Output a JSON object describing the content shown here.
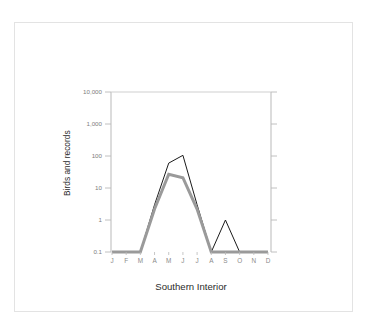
{
  "figure": {
    "title": "Southern Interior",
    "y_axis_label": "Birds and records"
  },
  "colors": {
    "series_birds": "#1a1a1a",
    "series_records": "#9a9a9a",
    "axis": "#b9b9b9",
    "tick_text": "#7d7d7d",
    "title_text": "#2b2b2b",
    "border": "#e3e3e3",
    "background": "#ffffff"
  },
  "chart_data": {
    "type": "line",
    "title": "Southern Interior",
    "xlabel": "Southern Interior",
    "ylabel": "Birds and records",
    "yscale": "log",
    "ylim": [
      0.1,
      10000
    ],
    "grid": false,
    "legend": "none",
    "categories": [
      "J",
      "F",
      "M",
      "A",
      "M",
      "J",
      "J",
      "A",
      "S",
      "O",
      "N",
      "D"
    ],
    "ytick_labels": [
      "10,000",
      "1,000",
      "100",
      "10",
      "1",
      "0.1"
    ],
    "ytick_values": [
      10000,
      1000,
      100,
      10,
      1,
      0.1
    ],
    "series": [
      {
        "name": "Birds",
        "color": "#1a1a1a",
        "linewidth": 1,
        "values": [
          0.1,
          0.1,
          0.1,
          3.0,
          60,
          105,
          3.0,
          0.1,
          1.0,
          0.1,
          0.1,
          0.1
        ]
      },
      {
        "name": "Records",
        "color": "#9a9a9a",
        "linewidth": 3,
        "values": [
          0.1,
          0.1,
          0.1,
          2.2,
          27,
          21,
          2.2,
          0.1,
          0.1,
          0.1,
          0.1,
          0.1
        ]
      }
    ]
  }
}
